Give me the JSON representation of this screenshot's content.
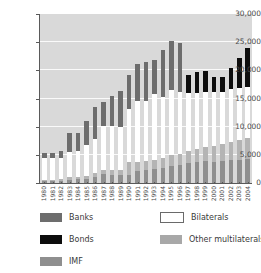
{
  "chart_data": {
    "type": "bar",
    "stacked": true,
    "title": "",
    "subtitle": "",
    "xlabel": "",
    "ylabel": "",
    "ylim": [
      0,
      30000
    ],
    "ytick_labels": [
      "0",
      "5,000",
      "10,000",
      "15,000",
      "20,000",
      "25,000",
      "30,000"
    ],
    "ytick_values": [
      0,
      5000,
      10000,
      15000,
      20000,
      25000,
      30000
    ],
    "grid": true,
    "legend_position": "bottom",
    "categories": [
      "1980",
      "1981",
      "1982",
      "1983",
      "1984",
      "1985",
      "1986",
      "1987",
      "1988",
      "1989",
      "1990",
      "1991",
      "1992",
      "1993",
      "1994",
      "1995",
      "1996",
      "1997",
      "1998",
      "1999",
      "2000",
      "2001",
      "2002",
      "2003",
      "2004"
    ],
    "series": [
      {
        "name": "IMF",
        "color": "#8f8f8f",
        "values": [
          300,
          320,
          360,
          620,
          700,
          760,
          1050,
          1550,
          1500,
          1450,
          1500,
          2200,
          2350,
          2500,
          2700,
          3050,
          3250,
          3550,
          3750,
          3900,
          3800,
          3900,
          4050,
          4150,
          4250
        ]
      },
      {
        "name": "Other multilaterals",
        "color": "#b4b4b4",
        "values": [
          250,
          280,
          320,
          380,
          420,
          560,
          700,
          850,
          900,
          900,
          2300,
          1550,
          1600,
          1600,
          1800,
          2000,
          1900,
          2200,
          2300,
          2550,
          2800,
          2950,
          3150,
          3400,
          3800
        ]
      },
      {
        "name": "Bilaterals",
        "color": "#ffffff",
        "values": [
          3950,
          3900,
          3820,
          4500,
          4480,
          5480,
          6050,
          7700,
          7700,
          7650,
          9400,
          10750,
          10650,
          11650,
          10800,
          11400,
          10950,
          10150,
          9900,
          9750,
          9500,
          9350,
          9450,
          9400,
          9000
        ]
      },
      {
        "name": "Banks",
        "color": "#6d6d6d",
        "values": [
          800,
          750,
          1100,
          3400,
          3200,
          4200,
          5700,
          4200,
          5300,
          6400,
          5900,
          6600,
          6800,
          6050,
          8350,
          8850,
          8750,
          0,
          0,
          0,
          0,
          0,
          0,
          0,
          0
        ]
      },
      {
        "name": "Bonds",
        "color": "#0d0d0d",
        "values": [
          0,
          0,
          0,
          0,
          0,
          0,
          0,
          0,
          0,
          0,
          0,
          0,
          0,
          0,
          0,
          0,
          0,
          3350,
          3800,
          3600,
          2800,
          2600,
          3750,
          5300,
          6850
        ]
      }
    ]
  },
  "legend": {
    "items": [
      {
        "label": "Banks",
        "color": "#6d6d6d",
        "border": false,
        "col": 0,
        "row": 0
      },
      {
        "label": "Bonds",
        "color": "#0d0d0d",
        "border": false,
        "col": 0,
        "row": 1
      },
      {
        "label": "IMF",
        "color": "#8f8f8f",
        "border": false,
        "col": 0,
        "row": 2
      },
      {
        "label": "Bilaterals",
        "color": "#ffffff",
        "border": true,
        "col": 1,
        "row": 0
      },
      {
        "label": "Other multilaterals",
        "color": "#a8a8a8",
        "border": false,
        "col": 1,
        "row": 1
      }
    ]
  }
}
